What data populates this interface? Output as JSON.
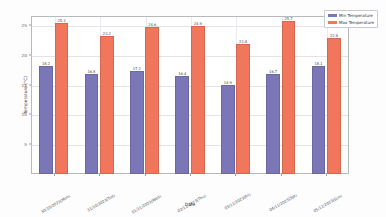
{
  "chart_data": {
    "type": "bar",
    "title": "",
    "xlabel": "Date",
    "ylabel": "Temperature (°C)",
    "ylim": [
      0,
      26.5
    ],
    "yticks": [
      5,
      10,
      15,
      20,
      25
    ],
    "ytick_labels": [
      "5",
      "10",
      "15",
      "20",
      "25"
    ],
    "grid": true,
    "legend_position": "upper right",
    "categories": [
      "30/10/2023(Mon)",
      "31/10/2023(Tue)",
      "01/11/2023(Wed)",
      "02/11/2023(Thu)",
      "03/11/2023(Fri)",
      "04/11/2023(Sat)",
      "05/11/2023(Sun)"
    ],
    "series": [
      {
        "name": "Min Temperature",
        "color": "#7b76b8",
        "values": [
          18.2,
          16.8,
          17.2,
          16.4,
          14.9,
          16.7,
          18.1
        ]
      },
      {
        "name": "Max Temperature",
        "color": "#f0775c",
        "values": [
          25.3,
          23.2,
          24.6,
          24.9,
          21.8,
          25.7,
          22.8
        ]
      }
    ],
    "bar_value_labels": [
      [
        "18.2",
        "25.3"
      ],
      [
        "16.8",
        "23.2"
      ],
      [
        "17.2",
        "24.6"
      ],
      [
        "16.4",
        "24.9"
      ],
      [
        "14.9",
        "21.8"
      ],
      [
        "16.7",
        "25.7"
      ],
      [
        "18.1",
        "22.8"
      ]
    ]
  },
  "legend": {
    "items": [
      {
        "label": "Min Temperature",
        "color": "#7b76b8"
      },
      {
        "label": "Max Temperature",
        "color": "#f0775c"
      }
    ]
  },
  "axes": {
    "x_title": "Date",
    "y_title": "Temperature (°C)"
  }
}
